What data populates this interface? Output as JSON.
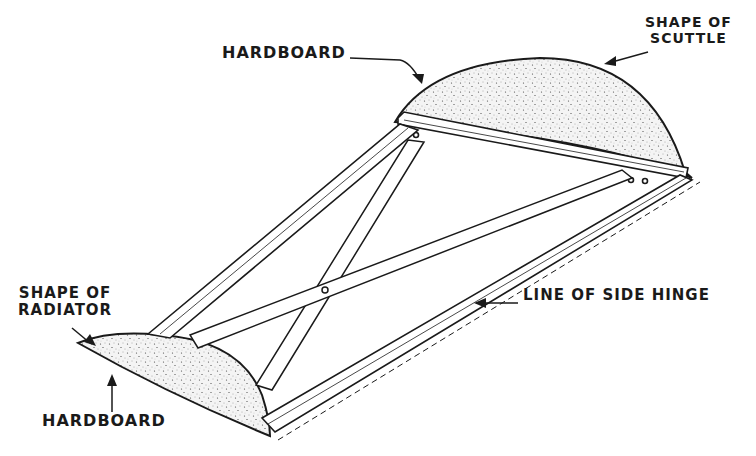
{
  "diagram": {
    "labels": {
      "hardboard_top": "HARDBOARD",
      "scuttle_line1": "SHAPE OF",
      "scuttle_line2": "SCUTTLE",
      "radiator_line1": "SHAPE OF",
      "radiator_line2": "RADIATOR",
      "side_hinge": "LINE OF SIDE HINGE",
      "hardboard_bottom": "HARDBOARD"
    },
    "colors": {
      "ink": "#1a1a1a",
      "paper": "#ffffff",
      "stipple": "#555555"
    }
  }
}
